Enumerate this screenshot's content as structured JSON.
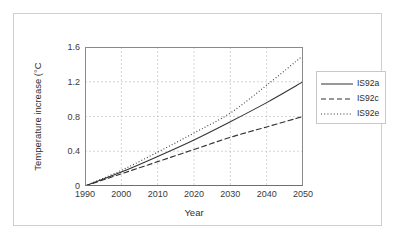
{
  "chart_data": {
    "type": "line",
    "title": "",
    "xlabel": "Year",
    "ylabel": "Temperature increase (°C",
    "xlim": [
      1990,
      2050
    ],
    "ylim": [
      0,
      1.6
    ],
    "xticks": [
      "1990",
      "2000",
      "2010",
      "2020",
      "2030",
      "2040",
      "2050"
    ],
    "yticks": [
      "0",
      "0.4",
      "0.8",
      "1.2",
      "1.6"
    ],
    "grid": true,
    "legend_position": "right",
    "x": [
      1990,
      2000,
      2010,
      2020,
      2030,
      2040,
      2050
    ],
    "series": [
      {
        "name": "IS92a",
        "style": "solid",
        "color": "#333333",
        "values": [
          0.0,
          0.16,
          0.34,
          0.53,
          0.74,
          0.96,
          1.2
        ]
      },
      {
        "name": "IS92c",
        "style": "dashed",
        "color": "#333333",
        "values": [
          0.0,
          0.14,
          0.28,
          0.42,
          0.56,
          0.68,
          0.8
        ]
      },
      {
        "name": "IS92e",
        "style": "dotted",
        "color": "#333333",
        "values": [
          0.0,
          0.18,
          0.39,
          0.61,
          0.84,
          1.16,
          1.5
        ]
      }
    ]
  },
  "legend": {
    "entries": [
      {
        "label": "IS92a",
        "style": "solid"
      },
      {
        "label": "IS92c",
        "style": "dashed"
      },
      {
        "label": "IS92e",
        "style": "dotted"
      }
    ]
  },
  "colors": {
    "line": "#333333",
    "grid": "#c4c4c4",
    "axis": "#7a7a7a",
    "frame": "#cfcfcf",
    "text": "#2b2b2b",
    "background": "#ffffff"
  }
}
